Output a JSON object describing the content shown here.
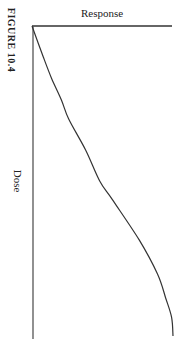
{
  "figure": {
    "caption": "FIGURE 10.4"
  },
  "chart_data": {
    "type": "line",
    "title": "",
    "caption": "FIGURE 10.4",
    "orientation": "rotated 90° clockwise (Response axis along top, Dose axis along left side)",
    "xlabel": "Dose",
    "ylabel": "Response",
    "grid": false,
    "legend": null,
    "ticks": "none",
    "series": [
      {
        "name": "dose-response curve",
        "shape": "sigmoid",
        "dose": [
          0,
          0.1,
          0.17,
          0.24,
          0.3,
          0.4,
          0.5,
          0.56,
          0.69,
          0.8,
          0.88,
          0.94,
          1.0
        ],
        "response": [
          0,
          0.08,
          0.14,
          0.21,
          0.26,
          0.38,
          0.48,
          0.57,
          0.76,
          0.89,
          0.95,
          0.99,
          1.0
        ]
      }
    ],
    "axis_colors": {
      "axes": "#333333",
      "curve": "#333333"
    }
  }
}
